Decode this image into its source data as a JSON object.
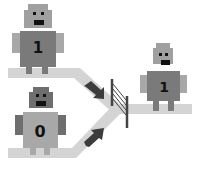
{
  "diagram": {
    "inputs": [
      {
        "id": "top-robot",
        "label": "1",
        "body_color": "#7a7a7a",
        "limb_color": "#a8a8a8"
      },
      {
        "id": "bottom-robot",
        "label": "0",
        "body_color": "#a8a8a8",
        "limb_color": "#6e6e6e"
      }
    ],
    "output": {
      "id": "output-robot",
      "label": "1",
      "body_color": "#7a7a7a",
      "limb_color": "#a8a8a8"
    },
    "colors": {
      "path": "#d4d4d4",
      "arrow": "#3c3c3c",
      "gate": "#444444",
      "head": "#a0a0a0",
      "eyes": "#111111"
    },
    "icons": [
      "robot-icon",
      "arrow-icon",
      "gate-icon"
    ]
  }
}
